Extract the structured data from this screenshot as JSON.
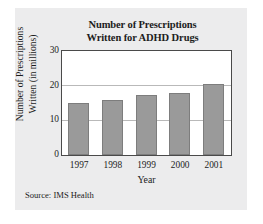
{
  "figure": {
    "panel_color": "#ececed",
    "plot_background": "#ffffff",
    "source_note": "Source: IMS Health"
  },
  "chart_data": {
    "type": "bar",
    "title": "Number of Prescriptions Written for ADHD Drugs",
    "title_line1": "Number of Prescriptions",
    "title_line2": "Written for ADHD Drugs",
    "xlabel": "Year",
    "ylabel": "Number of Prescriptions Written (in millions)",
    "ylabel_line1": "Number of Prescriptions",
    "ylabel_line2": "Written (in millions)",
    "categories": [
      "1997",
      "1998",
      "1999",
      "2000",
      "2001"
    ],
    "values": [
      15,
      16,
      17.5,
      18,
      20.5
    ],
    "ylim": [
      0,
      30
    ],
    "yticks": [
      "0",
      "10",
      "20",
      "30"
    ],
    "ytick_values": [
      0,
      10,
      20,
      30
    ],
    "grid": true,
    "grid_color": "#b9b9b9",
    "bar_color": "#9a9a9a",
    "bar_edge_color": "#7d7d7d",
    "legend": "none"
  }
}
